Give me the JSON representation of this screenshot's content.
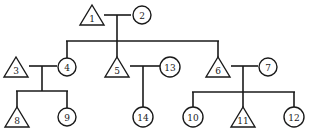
{
  "diagram": {
    "type": "pedigree",
    "colors": {
      "stroke": "#1a1a1a",
      "fill": "#ffffff",
      "background": "#ffffff"
    },
    "individuals": [
      {
        "id": "1",
        "shape": "triangle",
        "x": 92,
        "y": 16
      },
      {
        "id": "2",
        "shape": "circle",
        "x": 142,
        "y": 15
      },
      {
        "id": "3",
        "shape": "triangle",
        "x": 16,
        "y": 68
      },
      {
        "id": "4",
        "shape": "circle",
        "x": 67,
        "y": 67
      },
      {
        "id": "5",
        "shape": "triangle",
        "x": 117,
        "y": 68
      },
      {
        "id": "13",
        "shape": "circle",
        "x": 170,
        "y": 67
      },
      {
        "id": "6",
        "shape": "triangle",
        "x": 218,
        "y": 68
      },
      {
        "id": "7",
        "shape": "circle",
        "x": 268,
        "y": 67
      },
      {
        "id": "8",
        "shape": "triangle",
        "x": 17,
        "y": 118
      },
      {
        "id": "9",
        "shape": "circle",
        "x": 67,
        "y": 117
      },
      {
        "id": "14",
        "shape": "circle",
        "x": 143,
        "y": 117
      },
      {
        "id": "10",
        "shape": "circle",
        "x": 193,
        "y": 117
      },
      {
        "id": "11",
        "shape": "triangle",
        "x": 243,
        "y": 118
      },
      {
        "id": "12",
        "shape": "circle",
        "x": 294,
        "y": 117
      }
    ],
    "couples": [
      {
        "partners": [
          "1",
          "2"
        ],
        "children": [
          "4",
          "5",
          "6"
        ]
      },
      {
        "partners": [
          "3",
          "4"
        ],
        "children": [
          "8",
          "9"
        ]
      },
      {
        "partners": [
          "5",
          "13"
        ],
        "children": [
          "14"
        ]
      },
      {
        "partners": [
          "6",
          "7"
        ],
        "children": [
          "10",
          "11",
          "12"
        ]
      }
    ]
  }
}
